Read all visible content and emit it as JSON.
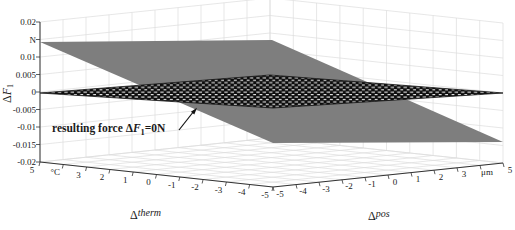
{
  "figure": {
    "colors": {
      "background": "#ffffff",
      "solid_plane": "#7e7e7e",
      "hatch_dark": "#0d0d0d",
      "hatch_light": "#f0f0f0",
      "grid": "#dcdcdc",
      "axis": "#333333",
      "text": "#1a1a1a"
    },
    "annotation": {
      "prefix": "resulting force Δ",
      "symbol": "F",
      "subscript": "1",
      "suffix": "=0N"
    },
    "z_axis_label": {
      "prefix": "Δ",
      "symbol": "F",
      "subscript": "1"
    },
    "therm_axis_label": {
      "prefix": "Δ",
      "sup": "therm"
    },
    "pos_axis_label": {
      "prefix": "Δ",
      "sup": "pos"
    }
  },
  "chart_data": {
    "type": "surface",
    "view": "3d-axonometric",
    "title": "",
    "z_axis": {
      "name": "ΔF1",
      "unit": "N",
      "min": -0.02,
      "max": 0.02,
      "tick_step": 0.005,
      "tick_labels": [
        "0.02",
        "N",
        "0.01",
        "0.005",
        "0",
        "-0.005",
        "-0.01",
        "-0.015",
        "-0.02"
      ],
      "note": "unit label N replaces the 0.015 tick"
    },
    "therm_axis": {
      "name": "Δtherm",
      "unit": "°C",
      "min": -5,
      "max": 5,
      "tick_labels": [
        "5",
        "°C",
        "3",
        "2",
        "1",
        "0",
        "-1",
        "-2",
        "-3",
        "-4",
        "-5"
      ],
      "note": "unit label °C replaces the 4 tick; runs from 5 at left corner to -5 at front corner"
    },
    "pos_axis": {
      "name": "Δpos",
      "unit": "μm",
      "min": -5,
      "max": 5,
      "tick_labels": [
        "-5",
        "-4",
        "-3",
        "-2",
        "-1",
        "0",
        "1",
        "2",
        "3",
        "μm",
        "5"
      ],
      "note": "unit label μm replaces the 4 tick; runs from -5 at front corner to 5 at right corner"
    },
    "grid": true,
    "surfaces": [
      {
        "id": "solid-gray-plane",
        "style": "solid gray fill",
        "corner_values": [
          {
            "therm": 5,
            "pos": -5,
            "dF1": 0.014
          },
          {
            "therm": 5,
            "pos": 5,
            "dF1": 0.0085
          },
          {
            "therm": -5,
            "pos": 5,
            "dF1": -0.014
          },
          {
            "therm": -5,
            "pos": -5,
            "dF1": -0.0075
          }
        ]
      },
      {
        "id": "hatched-plane",
        "style": "black/white woven hatch fill",
        "corner_values": [
          {
            "therm": 5,
            "pos": -5,
            "dF1": 0
          },
          {
            "therm": 5,
            "pos": 5,
            "dF1": -0.002
          },
          {
            "therm": -5,
            "pos": 5,
            "dF1": 0
          },
          {
            "therm": -5,
            "pos": -5,
            "dF1": 0.002
          }
        ]
      }
    ],
    "annotation": {
      "text": "resulting force ΔF1=0N",
      "target": "intersection line of the two planes where the resulting force is zero"
    }
  }
}
